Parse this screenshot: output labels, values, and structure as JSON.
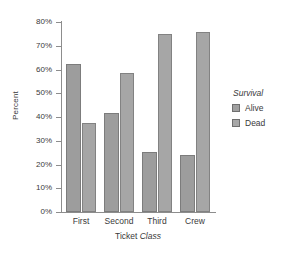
{
  "chart_data": {
    "type": "bar",
    "title": "",
    "xlabel": "Ticket Class",
    "xlabel_plain": "Ticket",
    "xlabel_italic": "Class",
    "ylabel": "Percent",
    "ylim": [
      0,
      80
    ],
    "ytick_labels": [
      "80%",
      "70%",
      "60%",
      "50%",
      "40%",
      "30%",
      "20%",
      "10%",
      "0%"
    ],
    "ytick_values": [
      80,
      70,
      60,
      50,
      40,
      30,
      20,
      10,
      0
    ],
    "grid": false,
    "legend_position": "right",
    "legend_title": "Survival",
    "categories": [
      "First",
      "Second",
      "Third",
      "Crew"
    ],
    "series": [
      {
        "name": "Alive",
        "color": "#9d9d9d",
        "values": [
          62.5,
          41.5,
          25.2,
          24.0
        ]
      },
      {
        "name": "Dead",
        "color": "#a6a6a6",
        "values": [
          37.5,
          58.6,
          74.8,
          76.0
        ]
      }
    ]
  }
}
